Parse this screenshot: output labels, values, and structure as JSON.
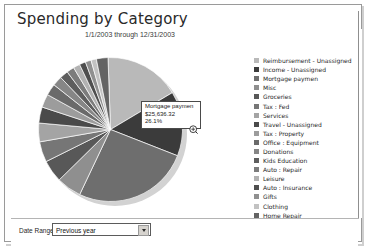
{
  "window": {
    "title": "Spending by Category"
  },
  "chart_panel": {
    "subtitle": "1/1/2003 through 12/31/2003"
  },
  "tooltip": {
    "name": "Mortgage paymen",
    "amount": "$25,636.32",
    "percent": "26.1%",
    "cursor_icon": "magnifier-plus-cursor"
  },
  "date_range": {
    "label": "Date Range:",
    "value": "Previous year",
    "dropdown_icon": "chevron-down-icon",
    "options": [
      "Previous year"
    ]
  },
  "chart_data": {
    "type": "pie",
    "title": "Spending by Category",
    "subtitle": "1/1/2003 through 12/31/2003",
    "legend_position": "right",
    "value_prefix": "$",
    "highlighted": "Mortgage paymen",
    "categories": [
      "Reimbursement - Unassigned",
      "Income - Unassigned",
      "Mortgage paymen",
      "Misc",
      "Groceries",
      "Tax : Fed",
      "Services",
      "Travel - Unassigned",
      "Tax : Property",
      "Office : Equipment",
      "Donations",
      "Kids Education",
      "Auto : Repair",
      "Leisure",
      "Auto : Insurance",
      "Gifts",
      "Clothing",
      "Home Repair"
    ],
    "percents": [
      17.0,
      14.5,
      26.1,
      5.6,
      5.0,
      4.6,
      4.2,
      3.6,
      3.0,
      2.6,
      2.2,
      1.9,
      1.7,
      1.5,
      1.4,
      1.3,
      1.2,
      2.6
    ],
    "values": [
      16700,
      14250,
      25636.32,
      5500,
      4910,
      4520,
      4130,
      3540,
      2950,
      2550,
      2160,
      1870,
      1670,
      1470,
      1375,
      1280,
      1180,
      2555
    ],
    "colors": [
      "#b9b9b9",
      "#3b3b3b",
      "#6e6e6e",
      "#8f8f8f",
      "#585858",
      "#767676",
      "#a4a4a4",
      "#4a4a4a",
      "#9c9c9c",
      "#6a6a6a",
      "#868686",
      "#5e5e5e",
      "#7c7c7c",
      "#b2b2b2",
      "#4f4f4f",
      "#909090",
      "#c2c2c2",
      "#636363"
    ]
  }
}
